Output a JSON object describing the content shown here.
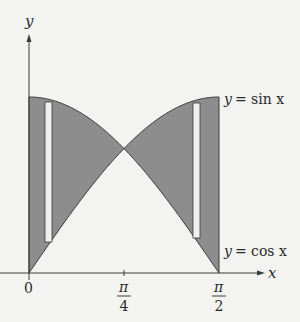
{
  "figure": {
    "colors": {
      "background": "#f3f3f1",
      "shade": "#8d8d8d",
      "stroke": "#3a3a3a",
      "strip": "#f0f0ee"
    },
    "axes": {
      "x_label": "x",
      "y_label": "y",
      "ticks": [
        {
          "label": "0",
          "value": 0
        },
        {
          "num": "π",
          "den": "4",
          "value": 0.7854
        },
        {
          "num": "π",
          "den": "2",
          "value": 1.5708
        }
      ]
    },
    "curves": [
      {
        "name": "sin",
        "label_lhs": "y",
        "label_rhs": "= sin x"
      },
      {
        "name": "cos",
        "label_lhs": "y",
        "label_rhs": "= cos x"
      }
    ],
    "strips": [
      {
        "x": 0.13,
        "description": "vertical representative rectangle in left region"
      },
      {
        "x": 1.44,
        "description": "vertical representative rectangle in right region"
      }
    ]
  }
}
